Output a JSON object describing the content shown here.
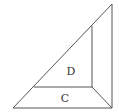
{
  "diagram": {
    "type": "geometry-figure",
    "stroke_color": "#555555",
    "background": "#ffffff",
    "labels": {
      "region_d": "D",
      "region_c": "C"
    },
    "points": {
      "outer_bottom_left": [
        13,
        108
      ],
      "outer_bottom_right": [
        112,
        108
      ],
      "outer_top": [
        112,
        4
      ],
      "inner_top": [
        92,
        26
      ],
      "inner_bottom_right": [
        92,
        87
      ],
      "inner_bottom_left": [
        34,
        87
      ]
    }
  }
}
